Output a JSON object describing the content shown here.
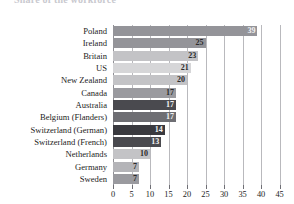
{
  "chart_data": {
    "type": "bar",
    "orientation": "horizontal",
    "title": "Share of the workforce",
    "xlabel": "",
    "ylabel": "",
    "xlim": [
      0,
      47
    ],
    "grid": true,
    "legend": false,
    "xticks": [
      0,
      5,
      10,
      15,
      20,
      25,
      30,
      35,
      40,
      45
    ],
    "categories": [
      "Poland",
      "Ireland",
      "Britain",
      "US",
      "New Zealand",
      "Canada",
      "Australia",
      "Belgium (Flanders)",
      "Switzerland (German)",
      "Switzerland (French)",
      "Netherlands",
      "Germany",
      "Sweden"
    ],
    "values": [
      39,
      25,
      23,
      21,
      20,
      17,
      17,
      17,
      14,
      13,
      10,
      7,
      7
    ],
    "bar_colors": [
      "#949499",
      "#949499",
      "#c3c3c6",
      "#d6d6d8",
      "#c3c3c6",
      "#9a9a9f",
      "#4a4a4f",
      "#6e6e73",
      "#3a3a3f",
      "#4a4a4f",
      "#c3c3c6",
      "#b4b4b8",
      "#9a9a9f"
    ],
    "value_label_inside": [
      true,
      false,
      false,
      false,
      false,
      false,
      true,
      true,
      true,
      true,
      false,
      false,
      false
    ]
  }
}
